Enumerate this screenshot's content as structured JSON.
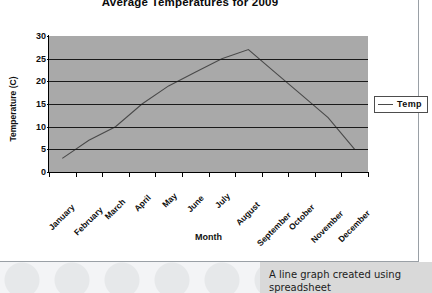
{
  "chart_data": {
    "type": "line",
    "title": "Average Temperatures for 2009",
    "xlabel": "Month",
    "ylabel": "Temperature (C)",
    "categories": [
      "January",
      "February",
      "March",
      "April",
      "May",
      "June",
      "July",
      "August",
      "September",
      "October",
      "November",
      "December"
    ],
    "series": [
      {
        "name": "Temp",
        "values": [
          3,
          7,
          10,
          15,
          19,
          22,
          25,
          27,
          22,
          17,
          12,
          5
        ]
      }
    ],
    "ylim": [
      0,
      30
    ],
    "ytick_step": 5,
    "yticks": [
      0,
      5,
      10,
      15,
      20,
      25,
      30
    ],
    "ytick_labels": [
      "0",
      "5",
      "10",
      "15",
      "20",
      "25",
      "30"
    ],
    "grid": true,
    "grid_axis": "y",
    "legend_position": "right",
    "plot_background": "#a9a9a9",
    "page_background": "#ffffff",
    "series_color": "#4a4a4a",
    "grid_color": "#1a1a1a",
    "axis_color": "#000000"
  },
  "legend": {
    "entries": [
      {
        "label": "Temp",
        "swatch": "line-swatch"
      }
    ]
  },
  "caption": {
    "text": "A line graph created using spreadsheet"
  }
}
